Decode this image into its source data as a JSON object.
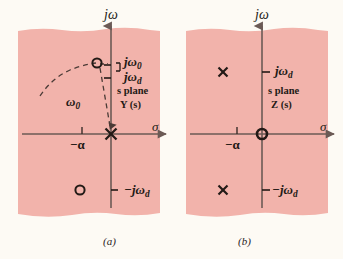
{
  "figure": {
    "background_color": "#fdfaf4",
    "panel_fill_color": "#f2b3ab",
    "ink_color": "#231a16",
    "axis_color": "#6b5a55"
  },
  "panels": [
    {
      "id": "a",
      "caption": "(a)",
      "plane_label": "s plane",
      "function_label": "Y (s)",
      "vertical_axis_label": "jω",
      "horizontal_axis_label": "σ",
      "axis_ticks": [
        {
          "name": "minus-alpha",
          "label": "−α",
          "axis": "real",
          "position": "left-of-origin"
        }
      ],
      "imaginary_axis_labels": [
        {
          "name": "j-omega-zero",
          "base": "jω",
          "sub": "0",
          "position": "upper"
        },
        {
          "name": "j-omega-d",
          "base": "jω",
          "sub": "d",
          "position": "upper"
        },
        {
          "name": "minus-j-omega-d",
          "base": "−jω",
          "sub": "d",
          "position": "lower"
        }
      ],
      "markers": [
        {
          "name": "pole-at-origin",
          "type": "pole",
          "glyph": "×",
          "location": "origin"
        },
        {
          "name": "zero-upper",
          "type": "zero",
          "glyph": "○",
          "location": "upper-left-quadrant"
        },
        {
          "name": "zero-lower",
          "type": "zero",
          "glyph": "○",
          "location": "lower-left-quadrant"
        }
      ],
      "annotations": [
        {
          "name": "omega-zero-radius",
          "base": "ω",
          "sub": "0",
          "style": "dashed-radius"
        },
        {
          "name": "radius-arc",
          "style": "dashed-arc"
        },
        {
          "name": "bracket-to-imaginary-labels",
          "style": "equals-bracket"
        }
      ]
    },
    {
      "id": "b",
      "caption": "(b)",
      "plane_label": "s plane",
      "function_label": "Z (s)",
      "vertical_axis_label": "jω",
      "horizontal_axis_label": "σ",
      "axis_ticks": [
        {
          "name": "minus-alpha",
          "label": "−α",
          "axis": "real",
          "position": "left-of-origin"
        }
      ],
      "imaginary_axis_labels": [
        {
          "name": "j-omega-d",
          "base": "jω",
          "sub": "d",
          "position": "upper"
        },
        {
          "name": "minus-j-omega-d",
          "base": "−jω",
          "sub": "d",
          "position": "lower"
        }
      ],
      "markers": [
        {
          "name": "zero-at-origin",
          "type": "zero",
          "glyph": "○",
          "location": "origin"
        },
        {
          "name": "pole-upper",
          "type": "pole",
          "glyph": "×",
          "location": "upper-left-quadrant"
        },
        {
          "name": "pole-lower",
          "type": "pole",
          "glyph": "×",
          "location": "lower-left-quadrant"
        }
      ],
      "annotations": []
    }
  ]
}
